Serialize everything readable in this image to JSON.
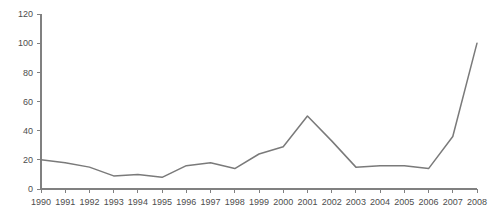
{
  "chart_data": {
    "type": "line",
    "title": "",
    "subtitle": "",
    "xlabel": "",
    "ylabel": "",
    "categories": [
      "1990",
      "1991",
      "1992",
      "1993",
      "1994",
      "1995",
      "1996",
      "1997",
      "1998",
      "1999",
      "2000",
      "2001",
      "2002",
      "2003",
      "2004",
      "2005",
      "2006",
      "2007",
      "2008"
    ],
    "values": [
      20,
      18,
      15,
      9,
      10,
      8,
      16,
      18,
      14,
      24,
      29,
      50,
      33,
      15,
      16,
      16,
      14,
      36,
      100
    ],
    "series": [
      {
        "name": "",
        "values": [
          20,
          18,
          15,
          9,
          10,
          8,
          16,
          18,
          14,
          24,
          29,
          50,
          33,
          15,
          16,
          16,
          14,
          36,
          100
        ]
      }
    ],
    "ylim": [
      0,
      120
    ],
    "yticks": [
      0,
      20,
      40,
      60,
      80,
      100,
      120
    ],
    "ytick_labels": [
      "0",
      "20",
      "40",
      "60",
      "80",
      "100",
      "120"
    ],
    "xtick_labels": [
      "1990",
      "1991",
      "1992",
      "1993",
      "1994",
      "1995",
      "1996",
      "1997",
      "1998",
      "1999",
      "2000",
      "2001",
      "2002",
      "2003",
      "2004",
      "2005",
      "2006",
      "2007",
      "2008"
    ],
    "grid": false,
    "legend": false,
    "legend_position": "none",
    "line_color": "#7a7a7a",
    "axis_color": "#808080",
    "label_color": "#4d4d4d",
    "background_color": "#ffffff"
  }
}
